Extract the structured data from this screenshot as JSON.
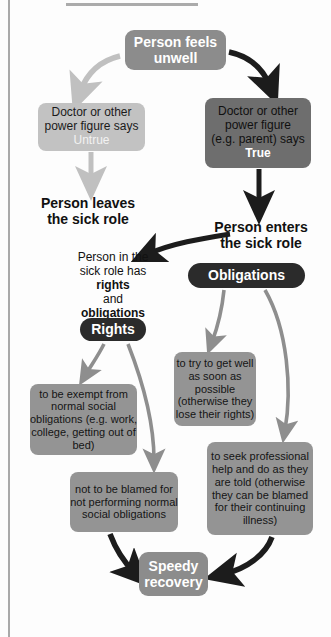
{
  "diagram": {
    "colors": {
      "accent_dark": "#2b2b2b",
      "box_mid": "#8c8c8c",
      "box_light": "#c2c2c2",
      "box_dark": "#6e6e6e",
      "box_body": "#949494",
      "arrow_dark": "#1c1c1c",
      "arrow_light": "#c0c0c0",
      "arrow_mid": "#8e8e8e",
      "text_light": "#ffffff",
      "text_dark": "#111111"
    },
    "nodes": {
      "unwell": {
        "label": "Person feels unwell"
      },
      "untrue": {
        "line1": "Doctor or other",
        "line2": "power figure says",
        "verdict": "Untrue"
      },
      "true": {
        "line1": "Doctor or other",
        "line2": "power figure",
        "line3": "(e.g. parent) says",
        "verdict": "True"
      },
      "leaves": {
        "line1": "Person leaves",
        "line2": "the sick role"
      },
      "enters": {
        "line1": "Person enters",
        "line2": "the sick role"
      },
      "has_pair": {
        "pre": "Person in the",
        "mid_a": "sick role has ",
        "em_a": "rights",
        "mid_b": "and ",
        "em_b": "obligations"
      },
      "obligations_heading": {
        "label": "Obligations"
      },
      "rights_heading": {
        "label": "Rights"
      },
      "right_exempt": {
        "label": "to be exempt from normal social obligations (e.g. work, college, getting out of bed)"
      },
      "right_not_blamed": {
        "label": "not to be blamed for not performing normal social obligations"
      },
      "obligation_get_well": {
        "label": "to try to get well as soon as possible (otherwise they lose their rights)"
      },
      "obligation_seek_help": {
        "label": "to seek professional help and do as they are told (otherwise they can be blamed for their continuing illness)"
      },
      "speedy": {
        "label": "Speedy recovery"
      }
    },
    "edges": [
      {
        "from": "unwell",
        "to": "untrue",
        "style": "light"
      },
      {
        "from": "unwell",
        "to": "true",
        "style": "dark"
      },
      {
        "from": "untrue",
        "to": "leaves",
        "style": "light"
      },
      {
        "from": "true",
        "to": "enters",
        "style": "dark"
      },
      {
        "from": "enters",
        "to": "has_pair",
        "style": "dark"
      },
      {
        "from": "rights_heading",
        "to": "right_exempt",
        "style": "mid"
      },
      {
        "from": "rights_heading",
        "to": "right_not_blamed",
        "style": "mid"
      },
      {
        "from": "obligations_heading",
        "to": "obligation_get_well",
        "style": "mid"
      },
      {
        "from": "obligations_heading",
        "to": "obligation_seek_help",
        "style": "mid"
      },
      {
        "from": "right_not_blamed",
        "to": "speedy",
        "style": "dark"
      },
      {
        "from": "obligation_seek_help",
        "to": "speedy",
        "style": "dark"
      }
    ]
  }
}
